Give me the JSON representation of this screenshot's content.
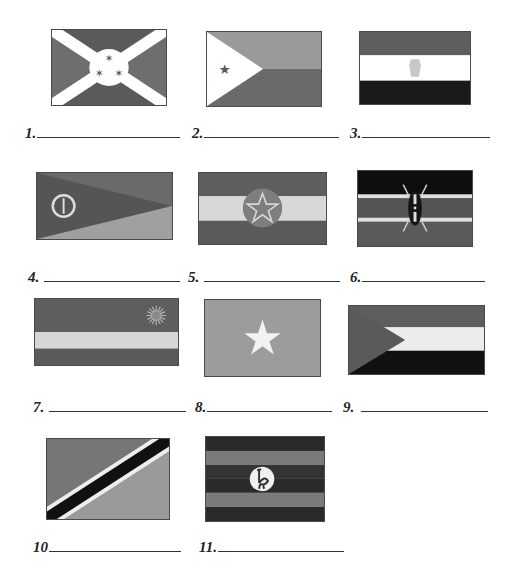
{
  "worksheet": {
    "flags": [
      {
        "number": "1.",
        "icon": "flag-burundi-icon",
        "colors": {
          "field_dark": "#5a5a5a",
          "field_mid": "#6e6e6e",
          "cross": "#ffffff",
          "stars": "#5a5a5a"
        }
      },
      {
        "number": "2.",
        "icon": "flag-djibouti-icon",
        "colors": {
          "top": "#9a9a9a",
          "bottom": "#6a6a6a",
          "triangle": "#ffffff",
          "star": "#5a5a5a"
        }
      },
      {
        "number": "3.",
        "icon": "flag-egypt-icon",
        "colors": {
          "top": "#5e5e5e",
          "middle": "#ffffff",
          "bottom": "#1a1a1a",
          "emblem": "#c8c8c8"
        }
      },
      {
        "number": "4.",
        "icon": "flag-eritrea-icon",
        "colors": {
          "top": "#6a6a6a",
          "bottom": "#a0a0a0",
          "triangle": "#555555",
          "emblem": "#dddddd"
        }
      },
      {
        "number": "5.",
        "icon": "flag-ethiopia-icon",
        "colors": {
          "top": "#5e5e5e",
          "middle": "#d8d8d8",
          "bottom": "#5a5a5a",
          "disc": "#7e7e7e",
          "star": "#d8d8d8"
        }
      },
      {
        "number": "6.",
        "icon": "flag-kenya-icon",
        "colors": {
          "top": "#0e0e0e",
          "fimbriation": "#e0e0e0",
          "middle": "#555555",
          "bottom": "#5a5a5a",
          "shield": "#151515"
        }
      },
      {
        "number": "7.",
        "icon": "flag-rwanda-icon",
        "colors": {
          "top": "#5e5e5e",
          "middle": "#d6d6d6",
          "bottom": "#5a5a5a",
          "sun": "#b0b0b0"
        }
      },
      {
        "number": "8.",
        "icon": "flag-somalia-icon",
        "colors": {
          "field": "#9c9c9c",
          "star": "#f2f2f2"
        }
      },
      {
        "number": "9.",
        "icon": "flag-sudan-icon",
        "colors": {
          "top": "#5e5e5e",
          "middle": "#ececec",
          "bottom": "#111111",
          "triangle": "#5a5a5a"
        }
      },
      {
        "number": "10",
        "icon": "flag-tanzania-icon",
        "colors": {
          "upper": "#767676",
          "lower": "#9a9a9a",
          "band": "#111111",
          "fimbriation": "#eeeeee"
        }
      },
      {
        "number": "11.",
        "icon": "flag-uganda-icon",
        "colors": {
          "dark": "#2a2a2a",
          "light": "#7a7a7a",
          "disc": "#f0f0f0",
          "bird": "#333333"
        }
      }
    ]
  }
}
